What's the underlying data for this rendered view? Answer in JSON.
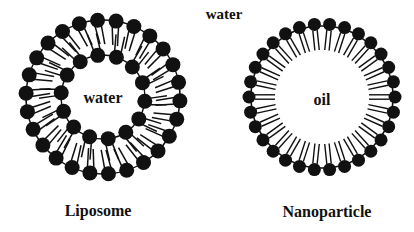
{
  "labels": {
    "outer_medium": "water",
    "liposome_core": "water",
    "nanoparticle_core": "oil",
    "liposome_caption": "Liposome",
    "nanoparticle_caption": "Nanoparticle"
  },
  "colors": {
    "ink": "#111111",
    "background": "#ffffff"
  },
  "structures": [
    {
      "name": "liposome",
      "type": "bilayer",
      "center": [
        103,
        97
      ],
      "outer_ring": {
        "radius": 77,
        "beads": 26,
        "bead_radius": 7.5,
        "tail_length": 24
      },
      "inner_ring": {
        "radius": 42,
        "beads": 14,
        "bead_radius": 7.5,
        "tail_length": 22
      }
    },
    {
      "name": "nanoparticle",
      "type": "monolayer",
      "center": [
        322,
        97
      ],
      "ring": {
        "radius": 73,
        "beads": 30,
        "bead_radius": 6.5,
        "tail_length": 20,
        "tail_gap": 2.2
      }
    }
  ]
}
